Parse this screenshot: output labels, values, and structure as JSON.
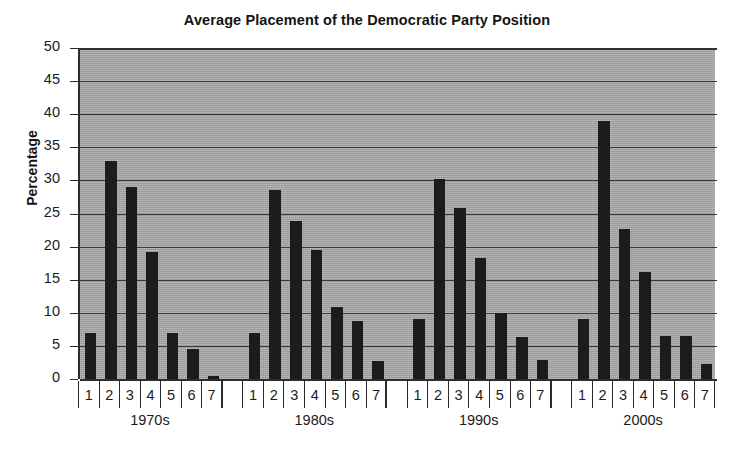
{
  "chart_data": {
    "type": "bar",
    "title": "Average Placement of the Democratic Party Position",
    "xlabel": "",
    "ylabel": "Percentage",
    "ylim": [
      0,
      50
    ],
    "ytick_step": 5,
    "yticks": [
      "50",
      "45",
      "40",
      "35",
      "30",
      "25",
      "20",
      "15",
      "10",
      "5",
      "0"
    ],
    "grid": true,
    "legend": "none",
    "bar_color": "#1c1c1c",
    "plot_background": "#a9a9a9",
    "categories": [
      "1",
      "2",
      "3",
      "4",
      "5",
      "6",
      "7"
    ],
    "groups": [
      "1970s",
      "1980s",
      "1990s",
      "2000s"
    ],
    "series": [
      {
        "name": "1970s",
        "values": [
          7.0,
          33.0,
          29.0,
          19.2,
          7.0,
          4.6,
          0.5
        ]
      },
      {
        "name": "1980s",
        "values": [
          7.0,
          28.5,
          23.9,
          19.5,
          10.9,
          8.8,
          2.7
        ]
      },
      {
        "name": "1990s",
        "values": [
          9.0,
          30.2,
          25.8,
          18.3,
          10.0,
          6.3,
          2.9
        ]
      },
      {
        "name": "2000s",
        "values": [
          9.0,
          39.0,
          22.7,
          16.2,
          6.5,
          6.5,
          2.2
        ]
      }
    ]
  }
}
